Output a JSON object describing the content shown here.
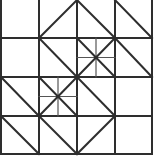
{
  "diagram": {
    "type": "grid-pattern",
    "grid": {
      "cols": 4,
      "rows": 4
    },
    "colors": {
      "background": "#ffffff",
      "stroke": "#2e2e2e",
      "thin_stroke": "#555555"
    },
    "x_lines": [
      1,
      39,
      77,
      115,
      152
    ],
    "y_lines": [
      0,
      38,
      77,
      116,
      154
    ],
    "diagonals": [
      {
        "col": 1,
        "row": 0,
        "dir": "/"
      },
      {
        "col": 2,
        "row": 0,
        "dir": "\\"
      },
      {
        "col": 3,
        "row": 0,
        "dir": "\\"
      },
      {
        "col": 1,
        "row": 1,
        "dir": "\\"
      },
      {
        "col": 3,
        "row": 1,
        "dir": "\\"
      },
      {
        "col": 0,
        "row": 2,
        "dir": "\\"
      },
      {
        "col": 2,
        "row": 2,
        "dir": "\\"
      },
      {
        "col": 0,
        "row": 3,
        "dir": "\\"
      },
      {
        "col": 1,
        "row": 3,
        "dir": "\\"
      },
      {
        "col": 2,
        "row": 3,
        "dir": "/"
      }
    ],
    "star_cells": [
      {
        "col": 2,
        "row": 1
      },
      {
        "col": 1,
        "row": 2
      }
    ]
  }
}
